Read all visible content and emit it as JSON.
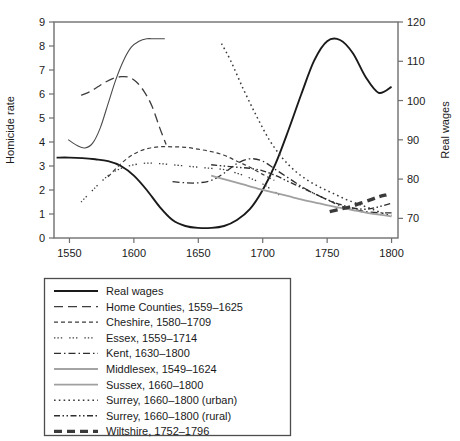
{
  "figure": {
    "background": "#ffffff",
    "frame_color": "#6f6f6f"
  },
  "axes": {
    "left": {
      "title": "Homicide rate",
      "ticks": [
        "0",
        "1",
        "2",
        "3",
        "4",
        "5",
        "6",
        "7",
        "8",
        "9"
      ],
      "min": 0,
      "max": 9
    },
    "right": {
      "title": "Real wages",
      "ticks": [
        "70",
        "80",
        "90",
        "100",
        "110",
        "120"
      ],
      "min": 65,
      "max": 120
    },
    "bottom": {
      "title": "",
      "ticks": [
        "1550",
        "1600",
        "1650",
        "1700",
        "1750",
        "1800"
      ],
      "min": 1538,
      "max": 1805
    }
  },
  "legend": {
    "items": [
      {
        "label": "Real wages",
        "key": "real_wages",
        "dash": "none",
        "width": 1.8,
        "color": "#1a1a1a"
      },
      {
        "label": "Home Counties, 1559–1625",
        "key": "home_counties",
        "dash": "long",
        "width": 1.4,
        "color": "#3a3a3a"
      },
      {
        "label": "Cheshire, 1580–1709",
        "key": "cheshire",
        "dash": "short",
        "width": 1.3,
        "color": "#3a3a3a"
      },
      {
        "label": "Essex, 1559–1714",
        "key": "essex",
        "dash": "dotgroup",
        "width": 1.3,
        "color": "#3a3a3a"
      },
      {
        "label": "Kent, 1630–1800",
        "key": "kent",
        "dash": "dashdot",
        "width": 1.3,
        "color": "#2e2e2e"
      },
      {
        "label": "Middlesex, 1549–1624",
        "key": "middlesex",
        "dash": "none",
        "width": 1.1,
        "color": "#4a4a4a"
      },
      {
        "label": "Sussex, 1660–1800",
        "key": "sussex",
        "dash": "none",
        "width": 1.6,
        "color": "#9e9e9e"
      },
      {
        "label": "Surrey, 1660–1800 (urban)",
        "key": "surrey_urban",
        "dash": "dot",
        "width": 1.5,
        "color": "#3a3a3a"
      },
      {
        "label": "Surrey, 1660–1800 (rural)",
        "key": "surrey_rural",
        "dash": "dashdotdot",
        "width": 1.4,
        "color": "#2e2e2e"
      },
      {
        "label": "Wiltshire, 1752–1796",
        "key": "wiltshire",
        "dash": "thickdash",
        "width": 3.2,
        "color": "#3a3a3a"
      }
    ]
  },
  "chart_data": {
    "type": "line",
    "title": "",
    "xlabel": "",
    "ylabel": "Homicide rate",
    "y2label": "Real wages",
    "xlim": [
      1538,
      1805
    ],
    "ylim": [
      0,
      9
    ],
    "y2lim": [
      65,
      120
    ],
    "grid": false,
    "legend_position": "below-plot",
    "xticks": [
      1550,
      1600,
      1650,
      1700,
      1750,
      1800
    ],
    "yticks": [
      0,
      1,
      2,
      3,
      4,
      5,
      6,
      7,
      8,
      9
    ],
    "y2ticks": [
      70,
      80,
      90,
      100,
      110,
      120
    ],
    "series": [
      {
        "name": "Real wages",
        "axis": "right",
        "style": "solid",
        "x": [
          1540,
          1550,
          1560,
          1570,
          1580,
          1590,
          1600,
          1610,
          1620,
          1630,
          1640,
          1650,
          1660,
          1670,
          1680,
          1690,
          1700,
          1710,
          1720,
          1730,
          1740,
          1750,
          1760,
          1770,
          1780,
          1790,
          1800
        ],
        "y_left_scale": [
          3.35,
          3.35,
          3.33,
          3.28,
          3.2,
          3.0,
          2.6,
          2.0,
          1.3,
          0.75,
          0.5,
          0.42,
          0.42,
          0.5,
          0.75,
          1.2,
          2.0,
          3.1,
          4.5,
          6.0,
          7.4,
          8.2,
          8.25,
          7.7,
          6.7,
          6.05,
          6.3
        ],
        "y": [
          85.5,
          85.5,
          85.4,
          85.1,
          84.6,
          83.4,
          81.0,
          77.3,
          73.0,
          69.7,
          68.2,
          67.7,
          67.7,
          68.2,
          69.7,
          72.4,
          77.3,
          84.0,
          92.5,
          101.6,
          110.1,
          115.0,
          115.3,
          112.0,
          106.0,
          102.1,
          103.6
        ]
      },
      {
        "name": "Middlesex, 1549–1624",
        "axis": "left",
        "style": "solid-thin",
        "x": [
          1549,
          1556,
          1562,
          1568,
          1574,
          1580,
          1586,
          1592,
          1598,
          1604,
          1610,
          1616,
          1624
        ],
        "y": [
          4.1,
          3.85,
          3.75,
          3.95,
          4.6,
          5.6,
          6.6,
          7.4,
          7.95,
          8.2,
          8.3,
          8.3,
          8.3
        ]
      },
      {
        "name": "Home Counties, 1559–1625",
        "axis": "left",
        "style": "dash-long",
        "x": [
          1559,
          1566,
          1572,
          1578,
          1584,
          1590,
          1596,
          1602,
          1608,
          1614,
          1620,
          1625
        ],
        "y": [
          5.95,
          6.1,
          6.3,
          6.5,
          6.65,
          6.72,
          6.7,
          6.5,
          6.1,
          5.5,
          4.6,
          3.9
        ]
      },
      {
        "name": "Cheshire, 1580–1709",
        "axis": "left",
        "style": "dash-short",
        "x": [
          1580,
          1590,
          1600,
          1610,
          1620,
          1630,
          1640,
          1650,
          1660,
          1670,
          1680,
          1690,
          1700,
          1709
        ],
        "y": [
          2.55,
          3.1,
          3.5,
          3.72,
          3.8,
          3.8,
          3.78,
          3.7,
          3.6,
          3.45,
          3.2,
          2.95,
          2.65,
          2.4
        ]
      },
      {
        "name": "Essex, 1559–1714",
        "axis": "left",
        "style": "dot-group",
        "x": [
          1559,
          1570,
          1580,
          1590,
          1600,
          1610,
          1620,
          1630,
          1640,
          1650,
          1660,
          1670,
          1680,
          1690,
          1700,
          1710,
          1714
        ],
        "y": [
          1.5,
          2.1,
          2.6,
          2.9,
          3.05,
          3.12,
          3.1,
          3.05,
          3.0,
          2.95,
          2.9,
          2.85,
          2.7,
          2.5,
          2.25,
          1.9,
          1.75
        ]
      },
      {
        "name": "Kent, 1630–1800",
        "axis": "left",
        "style": "dash-dot",
        "x": [
          1630,
          1640,
          1650,
          1660,
          1670,
          1680,
          1690,
          1700,
          1710,
          1720,
          1730,
          1740,
          1750,
          1760,
          1770,
          1780,
          1790,
          1800
        ],
        "y": [
          2.35,
          2.3,
          2.3,
          2.4,
          2.7,
          3.1,
          3.3,
          3.2,
          2.85,
          2.5,
          2.15,
          1.85,
          1.6,
          1.35,
          1.2,
          1.1,
          1.05,
          1.05
        ]
      },
      {
        "name": "Surrey, 1660–1800 (urban)",
        "axis": "left",
        "style": "dotted",
        "x": [
          1668,
          1675,
          1685,
          1695,
          1705,
          1715,
          1725,
          1735,
          1745,
          1755,
          1765,
          1775,
          1785,
          1795,
          1800
        ],
        "y": [
          8.1,
          7.4,
          6.2,
          5.1,
          4.1,
          3.35,
          2.8,
          2.4,
          2.1,
          1.85,
          1.6,
          1.4,
          1.2,
          1.0,
          0.95
        ]
      },
      {
        "name": "Surrey, 1660–1800 (rural)",
        "axis": "left",
        "style": "dash-dot-dot",
        "x": [
          1660,
          1670,
          1680,
          1690,
          1700,
          1710,
          1720,
          1730,
          1740,
          1750,
          1760,
          1770,
          1780,
          1790,
          1800
        ],
        "y": [
          3.05,
          3.0,
          2.95,
          2.9,
          2.8,
          2.6,
          2.35,
          2.1,
          1.85,
          1.6,
          1.4,
          1.25,
          1.2,
          1.3,
          1.45
        ]
      },
      {
        "name": "Sussex, 1660–1800",
        "axis": "left",
        "style": "solid-gray",
        "x": [
          1660,
          1672,
          1684,
          1696,
          1708,
          1720,
          1732,
          1744,
          1756,
          1768,
          1780,
          1792,
          1800
        ],
        "y": [
          2.6,
          2.42,
          2.24,
          2.06,
          1.9,
          1.74,
          1.58,
          1.44,
          1.3,
          1.18,
          1.06,
          0.96,
          0.9
        ]
      },
      {
        "name": "Wiltshire, 1752–1796",
        "axis": "left",
        "style": "thick-dash",
        "x": [
          1752,
          1760,
          1768,
          1776,
          1784,
          1790,
          1796
        ],
        "y": [
          1.1,
          1.2,
          1.3,
          1.45,
          1.6,
          1.72,
          1.8
        ]
      }
    ]
  }
}
